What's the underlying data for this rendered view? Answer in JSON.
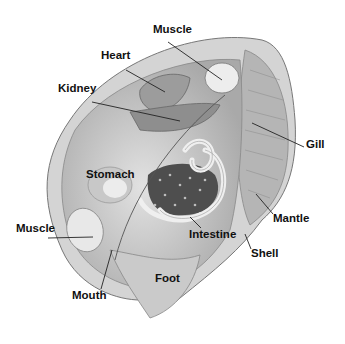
{
  "diagram": {
    "labels": [
      {
        "id": "muscle-top",
        "text": "Muscle",
        "x": 153,
        "y": 28
      },
      {
        "id": "heart",
        "text": "Heart",
        "x": 101,
        "y": 54
      },
      {
        "id": "kidney",
        "text": "Kidney",
        "x": 58,
        "y": 87
      },
      {
        "id": "gill",
        "text": "Gill",
        "x": 306,
        "y": 140
      },
      {
        "id": "stomach",
        "text": "Stomach",
        "x": 86,
        "y": 168
      },
      {
        "id": "mantle",
        "text": "Mantle",
        "x": 273,
        "y": 212
      },
      {
        "id": "muscle-left",
        "text": "Muscle",
        "x": 16,
        "y": 222
      },
      {
        "id": "intestine",
        "text": "Intestine",
        "x": 189,
        "y": 229
      },
      {
        "id": "shell",
        "text": "Shell",
        "x": 251,
        "y": 248
      },
      {
        "id": "foot",
        "text": "Foot",
        "x": 155,
        "y": 272
      },
      {
        "id": "mouth",
        "text": "Mouth",
        "x": 72,
        "y": 289
      }
    ],
    "leaders": [
      {
        "for": "muscle-top",
        "x1": 168,
        "y1": 42,
        "x2": 222,
        "y2": 80
      },
      {
        "for": "heart",
        "x1": 126,
        "y1": 70,
        "x2": 165,
        "y2": 92
      },
      {
        "for": "kidney",
        "x1": 92,
        "y1": 102,
        "x2": 180,
        "y2": 121
      },
      {
        "for": "gill",
        "x1": 304,
        "y1": 147,
        "x2": 252,
        "y2": 123
      },
      {
        "for": "mantle",
        "x1": 273,
        "y1": 214,
        "x2": 256,
        "y2": 194
      },
      {
        "for": "muscle-left",
        "x1": 48,
        "y1": 238,
        "x2": 93,
        "y2": 237
      },
      {
        "for": "intestine",
        "x1": 201,
        "y1": 228,
        "x2": 190,
        "y2": 217
      },
      {
        "for": "shell",
        "x1": 251,
        "y1": 249,
        "x2": 245,
        "y2": 234
      },
      {
        "for": "mouth",
        "x1": 101,
        "y1": 289,
        "x2": 112,
        "y2": 250
      }
    ],
    "colors": {
      "shell_outer": "#cfcfcf",
      "body": "#b8b8b8",
      "organ_light": "#e6e6e6",
      "organ_dark": "#5a5a5a",
      "line": "#222222",
      "text": "#111111"
    }
  }
}
